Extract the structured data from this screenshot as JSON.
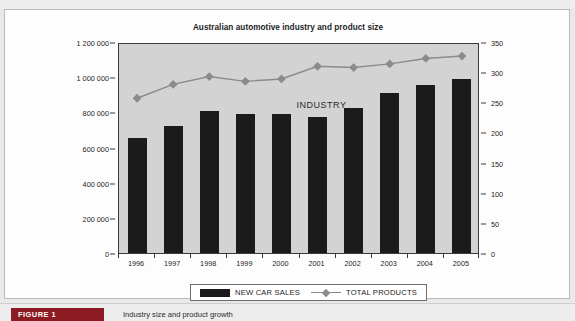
{
  "page": {
    "top_ghost_text": "",
    "background_color": "#e9e9e9"
  },
  "figure": {
    "badge_label": "FIGURE 1",
    "badge_color": "#8c1b24",
    "caption": "Industry size and product growth"
  },
  "chart_data": {
    "type": "bar",
    "title": "Australian automotive industry and product size",
    "xlabel": "",
    "ylabel": "",
    "grid": false,
    "legend_position": "bottom",
    "plot_background": "#d3d3d3",
    "annotations": [
      {
        "text": "INDUSTRY",
        "x": "2001",
        "y": 850000
      }
    ],
    "categories": [
      "1996",
      "1997",
      "1998",
      "1999",
      "2000",
      "2001",
      "2002",
      "2003",
      "2004",
      "2005"
    ],
    "axes": {
      "left": {
        "label": "",
        "ylim": [
          0,
          1200000
        ],
        "ticks": [
          0,
          200000,
          400000,
          600000,
          800000,
          1000000,
          1200000
        ],
        "tick_labels": [
          "0",
          "200 000",
          "400 000",
          "600 000",
          "800 000",
          "1 000 000",
          "1 200 000"
        ]
      },
      "right": {
        "label": "",
        "ylim": [
          0,
          350
        ],
        "ticks": [
          0,
          50,
          100,
          150,
          200,
          250,
          300,
          350
        ],
        "tick_labels": [
          "0",
          "50",
          "100",
          "150",
          "200",
          "250",
          "300",
          "350"
        ]
      }
    },
    "series": [
      {
        "name": "NEW CAR SALES",
        "type": "bar",
        "axis": "left",
        "color": "#1b1b1b",
        "values": [
          655000,
          725000,
          810000,
          788000,
          788000,
          775000,
          827000,
          910000,
          955000,
          988000
        ]
      },
      {
        "name": "TOTAL PRODUCTS",
        "type": "line",
        "axis": "right",
        "color": "#8b8b8b",
        "marker": "diamond",
        "values": [
          260,
          283,
          296,
          288,
          292,
          313,
          311,
          317,
          326,
          330
        ]
      }
    ]
  }
}
